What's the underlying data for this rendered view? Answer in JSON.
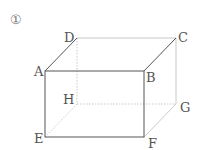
{
  "figure": {
    "number_label": "①",
    "shape": "rectangular prism",
    "vertices": {
      "A": "A",
      "B": "B",
      "C": "C",
      "D": "D",
      "E": "E",
      "F": "F",
      "G": "G",
      "H": "H"
    },
    "colors": {
      "edge": "#555555",
      "hidden_edge": "#bbbbbb",
      "label": "#555555"
    }
  }
}
